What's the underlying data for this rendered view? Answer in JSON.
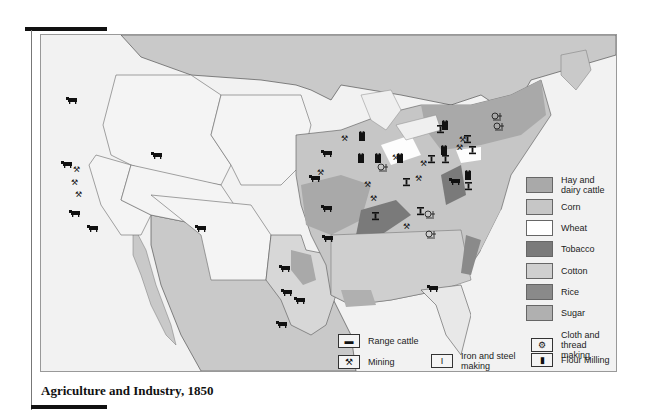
{
  "caption": "Agriculture and Industry, 1850",
  "crop_legend": {
    "items": [
      {
        "label": "Hay  and dairy cattle",
        "color": "#a9a9a9"
      },
      {
        "label": "Corn",
        "color": "#c6c6c6"
      },
      {
        "label": "Wheat",
        "color": "#ffffff"
      },
      {
        "label": "Tobacco",
        "color": "#7a7a7a"
      },
      {
        "label": "Cotton",
        "color": "#cfcfcf"
      },
      {
        "label": "Rice",
        "color": "#8a8a8a"
      },
      {
        "label": "Sugar",
        "color": "#b0b0b0"
      }
    ]
  },
  "industry_legend": {
    "range_cattle": "Range cattle",
    "mining": "Mining",
    "iron_steel": "Iron and steel making",
    "cloth_thread": "Cloth and thread making",
    "flour_milling": "Flour Milling"
  },
  "icons": {
    "range_cattle": "cattle-icon",
    "mining": "crossed-hammers-icon",
    "iron_steel": "i-beam-icon",
    "cloth_thread": "spinning-wheel-icon",
    "flour_milling": "flour-sack-icon"
  }
}
